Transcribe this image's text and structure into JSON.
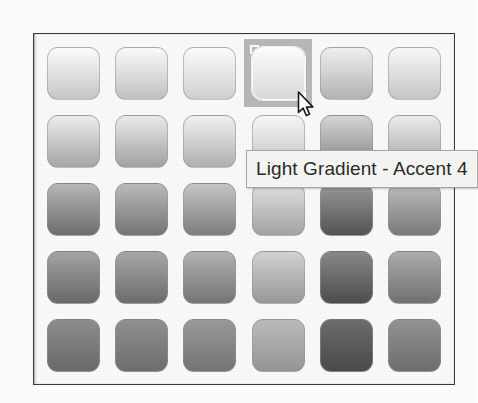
{
  "panel": {
    "name": "gradient-fill-gallery",
    "background_color": "#fbfbfb",
    "border_color": "#3a3a3a"
  },
  "tooltip": {
    "text": "Light Gradient - Accent 4",
    "background_color": "#f7f7f5",
    "border_color": "#a8a8a8",
    "text_color": "#2b2b2b"
  },
  "cursor": {
    "icon": "arrow-pointer-icon",
    "x": 263,
    "y": 57
  },
  "grid": {
    "rows": 5,
    "columns": 6,
    "hovered_row": 1,
    "hovered_column": 4,
    "hover_background": "#b9b9b9",
    "swatches": [
      [
        {
          "name": "Light Gradient - Accent 1",
          "top": "#ffffff",
          "bottom": "#c9c9c9"
        },
        {
          "name": "Light Gradient - Accent 2",
          "top": "#fdfdfd",
          "bottom": "#c4c4c4"
        },
        {
          "name": "Light Gradient - Accent 3",
          "top": "#ffffff",
          "bottom": "#d2d2d2"
        },
        {
          "name": "Light Gradient - Accent 4",
          "top": "#ffffff",
          "bottom": "#dcdcdc"
        },
        {
          "name": "Light Gradient - Accent 5",
          "top": "#f2f2f2",
          "bottom": "#b5b5b5"
        },
        {
          "name": "Light Gradient - Accent 6",
          "top": "#fbfbfb",
          "bottom": "#c8c8c8"
        }
      ],
      [
        {
          "name": "Light Gradient - Accent 1 Vertical",
          "top": "#f0f0f0",
          "bottom": "#a8a8a8"
        },
        {
          "name": "Light Gradient - Accent 2 Vertical",
          "top": "#ededed",
          "bottom": "#a3a3a3"
        },
        {
          "name": "Light Gradient - Accent 3 Vertical",
          "top": "#f4f4f4",
          "bottom": "#b2b2b2"
        },
        {
          "name": "Light Gradient - Accent 4 Vertical",
          "top": "#fafafa",
          "bottom": "#c6c6c6"
        },
        {
          "name": "Light Gradient - Accent 5 Vertical",
          "top": "#d8d8d8",
          "bottom": "#868686"
        },
        {
          "name": "Light Gradient - Accent 6 Vertical",
          "top": "#efefef",
          "bottom": "#a6a6a6"
        }
      ],
      [
        {
          "name": "Medium Gradient - Accent 1",
          "top": "#b9b9b9",
          "bottom": "#6f6f6f"
        },
        {
          "name": "Medium Gradient - Accent 2",
          "top": "#bcbcbc",
          "bottom": "#767676"
        },
        {
          "name": "Medium Gradient - Accent 3",
          "top": "#c8c8c8",
          "bottom": "#808080"
        },
        {
          "name": "Medium Gradient - Accent 4",
          "top": "#e2e2e2",
          "bottom": "#a5a5a5"
        },
        {
          "name": "Medium Gradient - Accent 5",
          "top": "#9a9a9a",
          "bottom": "#555555"
        },
        {
          "name": "Medium Gradient - Accent 6",
          "top": "#bfbfbf",
          "bottom": "#7b7b7b"
        }
      ],
      [
        {
          "name": "Medium Gradient - Accent 1 Dark",
          "top": "#a6a6a6",
          "bottom": "#6a6a6a"
        },
        {
          "name": "Medium Gradient - Accent 2 Dark",
          "top": "#a9a9a9",
          "bottom": "#6e6e6e"
        },
        {
          "name": "Medium Gradient - Accent 3 Dark",
          "top": "#b4b4b4",
          "bottom": "#767676"
        },
        {
          "name": "Medium Gradient - Accent 4 Dark",
          "top": "#d4d4d4",
          "bottom": "#9a9a9a"
        },
        {
          "name": "Medium Gradient - Accent 5 Dark",
          "top": "#8a8a8a",
          "bottom": "#4e4e4e"
        },
        {
          "name": "Medium Gradient - Accent 6 Dark",
          "top": "#aeaeae",
          "bottom": "#727272"
        }
      ],
      [
        {
          "name": "Dark Gradient - Accent 1",
          "top": "#8f8f8f",
          "bottom": "#6b6b6b"
        },
        {
          "name": "Dark Gradient - Accent 2",
          "top": "#929292",
          "bottom": "#6f6f6f"
        },
        {
          "name": "Dark Gradient - Accent 3",
          "top": "#9b9b9b",
          "bottom": "#767676"
        },
        {
          "name": "Dark Gradient - Accent 4",
          "top": "#bdbdbd",
          "bottom": "#979797"
        },
        {
          "name": "Dark Gradient - Accent 5",
          "top": "#6d6d6d",
          "bottom": "#4b4b4b"
        },
        {
          "name": "Dark Gradient - Accent 6",
          "top": "#949494",
          "bottom": "#6f6f6f"
        }
      ]
    ]
  }
}
